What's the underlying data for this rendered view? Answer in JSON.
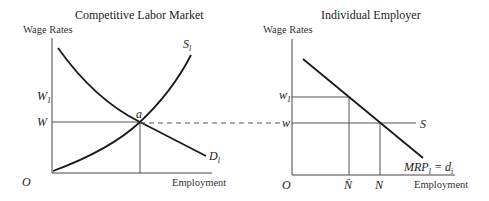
{
  "left_panel": {
    "title": "Competitive Labor Market",
    "y_axis_label": "Wage Rates",
    "x_axis_label": "Employment",
    "origin_label": "O",
    "y_ticks": [
      {
        "label": "W",
        "sub": "1"
      },
      {
        "label": "W",
        "sub": ""
      }
    ],
    "supply_label": {
      "main": "S",
      "sub": "l"
    },
    "demand_label": {
      "main": "D",
      "sub": "l"
    },
    "equilibrium_label": "a"
  },
  "right_panel": {
    "title": "Individual Employer",
    "y_axis_label": "Wage Rates",
    "x_axis_label": "Employment",
    "origin_label": "O",
    "y_ticks": [
      {
        "label": "w",
        "sub": "1"
      },
      {
        "label": "w",
        "sub": ""
      }
    ],
    "x_ticks": [
      {
        "label": "N̄"
      },
      {
        "label": "N"
      }
    ],
    "supply_label": "S",
    "mrp_label": {
      "main": "MRP",
      "sub": "l",
      "rest": " = d",
      "rest_sub": "i"
    }
  },
  "colors": {
    "line": "#1a1a1a",
    "axis": "#444444",
    "guide": "#555555",
    "text": "#222222"
  }
}
